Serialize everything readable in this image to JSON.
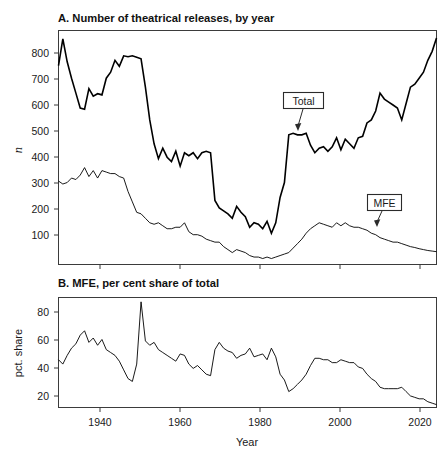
{
  "figure": {
    "width": 445,
    "height": 456,
    "background": "#ffffff",
    "ink": "#000000"
  },
  "panel_a": {
    "title": "A. Number of theatrical releases, by year",
    "ylabel": "n",
    "ytick_labels": [
      "800",
      "700",
      "600",
      "500",
      "400",
      "300",
      "200",
      "100"
    ],
    "annotations": [
      {
        "label": "Total"
      },
      {
        "label": "MFE"
      }
    ]
  },
  "panel_b": {
    "title": "B. MFE, per cent share of total",
    "ylabel": "pct. share",
    "ytick_labels": [
      "80",
      "60",
      "40",
      "20"
    ]
  },
  "xaxis": {
    "label": "Year",
    "tick_labels": [
      "1940",
      "1960",
      "1980",
      "2000",
      "2020"
    ]
  },
  "chart_data": [
    {
      "type": "line",
      "title": "A. Number of theatrical releases, by year",
      "xlabel": "Year",
      "ylabel": "n",
      "xlim": [
        1932,
        2019
      ],
      "ylim": [
        75,
        860
      ],
      "grid": false,
      "legend": "inline annotations (Total, MFE)",
      "x": [
        1932,
        1933,
        1934,
        1935,
        1936,
        1937,
        1938,
        1939,
        1940,
        1941,
        1942,
        1943,
        1944,
        1945,
        1946,
        1947,
        1948,
        1949,
        1950,
        1951,
        1952,
        1953,
        1954,
        1955,
        1956,
        1957,
        1958,
        1959,
        1960,
        1961,
        1962,
        1963,
        1964,
        1965,
        1966,
        1967,
        1968,
        1969,
        1970,
        1971,
        1972,
        1973,
        1974,
        1975,
        1976,
        1977,
        1978,
        1979,
        1980,
        1981,
        1982,
        1983,
        1984,
        1985,
        1986,
        1987,
        1988,
        1989,
        1990,
        1991,
        1992,
        1993,
        1994,
        1995,
        1996,
        1997,
        1998,
        1999,
        2000,
        2001,
        2002,
        2003,
        2004,
        2005,
        2006,
        2007,
        2008,
        2009,
        2010,
        2011,
        2012,
        2013,
        2014,
        2015,
        2016,
        2017,
        2018,
        2019
      ],
      "series": [
        {
          "name": "Total",
          "values": [
            742,
            832,
            755,
            700,
            650,
            600,
            596,
            665,
            640,
            648,
            644,
            700,
            720,
            760,
            740,
            775,
            772,
            775,
            770,
            765,
            670,
            560,
            480,
            430,
            465,
            435,
            420,
            455,
            405,
            450,
            440,
            450,
            430,
            450,
            455,
            450,
            290,
            265,
            255,
            245,
            230,
            270,
            250,
            235,
            200,
            215,
            210,
            195,
            220,
            180,
            215,
            300,
            350,
            510,
            515,
            510,
            510,
            515,
            475,
            450,
            465,
            470,
            455,
            470,
            500,
            460,
            495,
            480,
            465,
            500,
            505,
            550,
            560,
            590,
            650,
            630,
            620,
            610,
            600,
            560,
            615,
            670,
            680,
            700,
            720,
            760,
            790,
            835
          ]
        },
        {
          "name": "MFE",
          "values": [
            355,
            345,
            350,
            365,
            360,
            375,
            400,
            370,
            390,
            365,
            390,
            385,
            380,
            380,
            370,
            365,
            320,
            285,
            250,
            245,
            230,
            215,
            210,
            215,
            205,
            195,
            195,
            200,
            200,
            215,
            185,
            175,
            175,
            170,
            160,
            155,
            150,
            150,
            135,
            125,
            115,
            125,
            120,
            115,
            105,
            100,
            100,
            95,
            100,
            95,
            100,
            105,
            110,
            115,
            130,
            145,
            160,
            180,
            195,
            205,
            215,
            210,
            205,
            200,
            215,
            205,
            215,
            205,
            200,
            200,
            195,
            190,
            180,
            175,
            165,
            160,
            155,
            150,
            150,
            145,
            140,
            135,
            132,
            128,
            125,
            122,
            120,
            118
          ]
        }
      ]
    },
    {
      "type": "line",
      "title": "B. MFE, per cent share of total",
      "xlabel": "Year",
      "ylabel": "pct. share",
      "xlim": [
        1932,
        2019
      ],
      "ylim": [
        12,
        88
      ],
      "grid": false,
      "x": [
        1932,
        1933,
        1934,
        1935,
        1936,
        1937,
        1938,
        1939,
        1940,
        1941,
        1942,
        1943,
        1944,
        1945,
        1946,
        1947,
        1948,
        1949,
        1950,
        1951,
        1952,
        1953,
        1954,
        1955,
        1956,
        1957,
        1958,
        1959,
        1960,
        1961,
        1962,
        1963,
        1964,
        1965,
        1966,
        1967,
        1968,
        1969,
        1970,
        1971,
        1972,
        1973,
        1974,
        1975,
        1976,
        1977,
        1978,
        1979,
        1980,
        1981,
        1982,
        1983,
        1984,
        1985,
        1986,
        1987,
        1988,
        1989,
        1990,
        1991,
        1992,
        1993,
        1994,
        1995,
        1996,
        1997,
        1998,
        1999,
        2000,
        2001,
        2002,
        2003,
        2004,
        2005,
        2006,
        2007,
        2008,
        2009,
        2010,
        2011,
        2012,
        2013,
        2014,
        2015,
        2016,
        2017,
        2018,
        2019
      ],
      "series": [
        {
          "name": "MFE share of total (%)",
          "values": [
            45,
            42,
            48,
            53,
            56,
            62,
            65,
            57,
            60,
            55,
            59,
            52,
            50,
            48,
            44,
            38,
            32,
            30,
            42,
            85,
            58,
            55,
            57,
            52,
            50,
            48,
            46,
            44,
            49,
            48,
            42,
            39,
            41,
            38,
            35,
            34,
            52,
            57,
            53,
            51,
            50,
            46,
            48,
            49,
            53,
            47,
            48,
            49,
            45,
            53,
            47,
            35,
            31,
            23,
            25,
            28,
            31,
            35,
            41,
            46,
            46,
            45,
            45,
            43,
            43,
            45,
            44,
            43,
            43,
            40,
            39,
            35,
            32,
            30,
            26,
            25,
            25,
            25,
            25,
            26,
            23,
            20,
            19,
            18,
            18,
            16,
            15,
            14
          ]
        }
      ]
    }
  ]
}
